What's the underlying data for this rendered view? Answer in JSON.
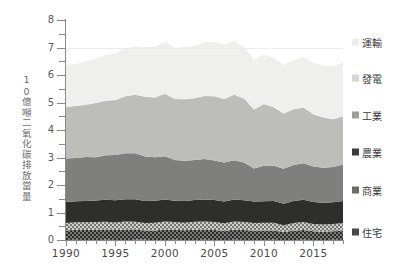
{
  "axes": {
    "y_title": "10億噸二氧化碳排放當量",
    "y_ticks": [
      "8",
      "7",
      "6",
      "5",
      "4",
      "3",
      "2",
      "1",
      "0"
    ],
    "x_ticks": [
      "1990",
      "1995",
      "2000",
      "2005",
      "2010",
      "2015"
    ]
  },
  "legend": {
    "items": [
      {
        "label": "運輸",
        "color": "#f2f2f0",
        "swatch": "#eeeeec"
      },
      {
        "label": "發電",
        "color": "#d8d8d4",
        "swatch": "#d6d6d2"
      },
      {
        "label": "工業",
        "color": "#b9b9b6",
        "swatch": "#9d9d9a"
      },
      {
        "label": "農業",
        "color": "#7f7f7d",
        "swatch": "#3b3b3a"
      },
      {
        "label": "商業",
        "color": "#2e2e2d",
        "swatch": "#6b6b69"
      },
      {
        "label": "住宅",
        "color": "#4e4e4c",
        "swatch": "#4a4a48"
      }
    ]
  },
  "chart_data": {
    "type": "area",
    "title": "",
    "subtitle": "",
    "xlabel": "",
    "ylabel": "10億噸二氧化碳排放當量",
    "xlim": [
      1990,
      2018
    ],
    "ylim": [
      0,
      8
    ],
    "grid": false,
    "legend_position": "right",
    "stacked": true,
    "x": [
      1990,
      1991,
      1992,
      1993,
      1994,
      1995,
      1996,
      1997,
      1998,
      1999,
      2000,
      2001,
      2002,
      2003,
      2004,
      2005,
      2006,
      2007,
      2008,
      2009,
      2010,
      2011,
      2012,
      2013,
      2014,
      2015,
      2016,
      2017,
      2018
    ],
    "series": [
      {
        "name": "住宅",
        "color": "#4e4e4c",
        "pattern": "checker-dark",
        "values": [
          0.35,
          0.36,
          0.37,
          0.38,
          0.37,
          0.36,
          0.39,
          0.37,
          0.34,
          0.36,
          0.38,
          0.36,
          0.36,
          0.38,
          0.37,
          0.37,
          0.34,
          0.37,
          0.36,
          0.35,
          0.34,
          0.34,
          0.3,
          0.34,
          0.35,
          0.32,
          0.31,
          0.31,
          0.34
        ]
      },
      {
        "name": "商業",
        "color": "#9a9a96",
        "pattern": "checker-light",
        "values": [
          0.27,
          0.27,
          0.28,
          0.28,
          0.28,
          0.28,
          0.29,
          0.29,
          0.27,
          0.28,
          0.29,
          0.28,
          0.28,
          0.29,
          0.29,
          0.29,
          0.28,
          0.29,
          0.29,
          0.28,
          0.28,
          0.28,
          0.25,
          0.28,
          0.29,
          0.27,
          0.26,
          0.26,
          0.28
        ]
      },
      {
        "name": "農業",
        "color": "#2e2e2d",
        "pattern": "solid",
        "values": [
          0.76,
          0.77,
          0.78,
          0.78,
          0.8,
          0.81,
          0.81,
          0.81,
          0.8,
          0.8,
          0.8,
          0.78,
          0.79,
          0.79,
          0.8,
          0.8,
          0.79,
          0.8,
          0.79,
          0.78,
          0.79,
          0.79,
          0.78,
          0.8,
          0.81,
          0.8,
          0.79,
          0.79,
          0.8
        ]
      },
      {
        "name": "工業",
        "color": "#7f7f7d",
        "pattern": "solid",
        "values": [
          1.58,
          1.57,
          1.6,
          1.58,
          1.62,
          1.64,
          1.68,
          1.68,
          1.62,
          1.58,
          1.57,
          1.48,
          1.46,
          1.45,
          1.47,
          1.43,
          1.42,
          1.43,
          1.37,
          1.2,
          1.29,
          1.28,
          1.27,
          1.31,
          1.33,
          1.29,
          1.28,
          1.28,
          1.32
        ]
      },
      {
        "name": "發電",
        "color": "#bdbdba",
        "pattern": "solid",
        "values": [
          1.88,
          1.89,
          1.9,
          1.97,
          1.98,
          2.0,
          2.07,
          2.12,
          2.17,
          2.17,
          2.28,
          2.22,
          2.24,
          2.25,
          2.29,
          2.34,
          2.31,
          2.38,
          2.33,
          2.15,
          2.24,
          2.13,
          2.01,
          2.03,
          2.03,
          1.9,
          1.82,
          1.74,
          1.76
        ]
      },
      {
        "name": "運輸",
        "color": "#efefed",
        "pattern": "solid",
        "values": [
          1.54,
          1.53,
          1.58,
          1.61,
          1.66,
          1.69,
          1.74,
          1.76,
          1.8,
          1.85,
          1.89,
          1.86,
          1.9,
          1.9,
          1.96,
          1.97,
          1.98,
          1.97,
          1.87,
          1.8,
          1.8,
          1.78,
          1.77,
          1.79,
          1.83,
          1.87,
          1.9,
          1.93,
          1.97
        ]
      }
    ],
    "totals": [
      6.38,
      6.39,
      6.51,
      6.6,
      6.71,
      6.78,
      6.98,
      7.03,
      7.0,
      7.04,
      7.21,
      6.98,
      7.03,
      7.06,
      7.18,
      7.2,
      7.12,
      7.24,
      7.01,
      6.56,
      6.74,
      6.6,
      6.38,
      6.55,
      6.64,
      6.45,
      6.36,
      6.31,
      6.47
    ]
  }
}
